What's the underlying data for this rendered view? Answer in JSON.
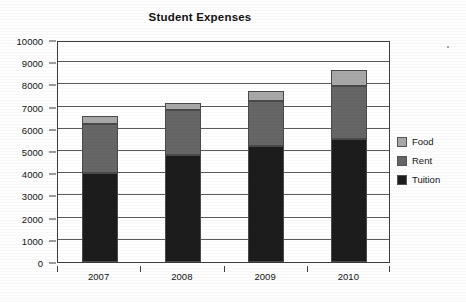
{
  "chart_data": {
    "type": "bar",
    "stacked": true,
    "title": "Student Expenses",
    "xlabel": "",
    "ylabel": "",
    "categories": [
      "2007",
      "2008",
      "2009",
      "2010"
    ],
    "series": [
      {
        "name": "Tuition",
        "values": [
          4000,
          4820,
          5230,
          5550
        ],
        "color": "#1c1c1c"
      },
      {
        "name": "Rent",
        "values": [
          2200,
          2030,
          2020,
          2400
        ],
        "color": "#666666"
      },
      {
        "name": "Food",
        "values": [
          400,
          300,
          450,
          700
        ],
        "color": "#a8a8a8"
      }
    ],
    "totals": [
      6600,
      7150,
      7700,
      8650
    ],
    "ylim": [
      0,
      10000
    ],
    "ytick_step": 1000,
    "yticks": [
      0,
      1000,
      2000,
      3000,
      4000,
      5000,
      6000,
      7000,
      8000,
      9000,
      10000
    ],
    "ytick_labels": [
      "0",
      "1000",
      "2000",
      "3000",
      "4000",
      "5000",
      "6000",
      "7000",
      "8000",
      "9000",
      "10000"
    ],
    "grid": true,
    "grid_axis": "y",
    "legend_position": "right",
    "legend_entries": [
      "Food",
      "Rent",
      "Tuition"
    ],
    "background_color": "#ffffff",
    "axis_color": "#3d3d3d"
  }
}
